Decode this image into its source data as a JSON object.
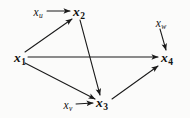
{
  "figure": {
    "type": "directed-acyclic-graph",
    "background_color": "#fbfbfa",
    "stroke_color": "#1a1a1a",
    "nodes": [
      {
        "id": "x1",
        "var": "x",
        "sub": "1",
        "label": "x1",
        "style": "numbered",
        "x": 20,
        "y": 58
      },
      {
        "id": "x2",
        "var": "x",
        "sub": "2",
        "label": "x2",
        "style": "numbered",
        "x": 79,
        "y": 12
      },
      {
        "id": "x3",
        "var": "x",
        "sub": "3",
        "label": "x3",
        "style": "numbered",
        "x": 102,
        "y": 103
      },
      {
        "id": "x4",
        "var": "x",
        "sub": "4",
        "label": "x4",
        "style": "numbered",
        "x": 167,
        "y": 58
      },
      {
        "id": "xu",
        "var": "x",
        "sub": "u",
        "label": "xu",
        "style": "exo",
        "x": 38,
        "y": 11
      },
      {
        "id": "xv",
        "var": "x",
        "sub": "v",
        "label": "xv",
        "style": "exo",
        "x": 68,
        "y": 104
      },
      {
        "id": "xw",
        "var": "x",
        "sub": "w",
        "label": "xw",
        "style": "exo",
        "x": 161,
        "y": 22
      }
    ],
    "edges": [
      {
        "id": "xu-x2",
        "from": "xu",
        "to": "x2",
        "x1": 47,
        "y1": 11,
        "x2": 70,
        "y2": 11
      },
      {
        "id": "x1-x2",
        "from": "x1",
        "to": "x2",
        "x1": 25,
        "y1": 52,
        "x2": 72,
        "y2": 19
      },
      {
        "id": "x1-x4",
        "from": "x1",
        "to": "x4",
        "x1": 28,
        "y1": 57,
        "x2": 158,
        "y2": 57
      },
      {
        "id": "x1-x3",
        "from": "x1",
        "to": "x3",
        "x1": 25,
        "y1": 63,
        "x2": 95,
        "y2": 99
      },
      {
        "id": "x2-x3",
        "from": "x2",
        "to": "x3",
        "x1": 80,
        "y1": 20,
        "x2": 100,
        "y2": 95
      },
      {
        "id": "xv-x3",
        "from": "xv",
        "to": "x3",
        "x1": 76,
        "y1": 104,
        "x2": 93,
        "y2": 103
      },
      {
        "id": "x3-x4",
        "from": "x3",
        "to": "x4",
        "x1": 112,
        "y1": 99,
        "x2": 158,
        "y2": 66
      },
      {
        "id": "xw-x4",
        "from": "xw",
        "to": "x4",
        "x1": 160,
        "y1": 29,
        "x2": 166,
        "y2": 50
      }
    ]
  }
}
